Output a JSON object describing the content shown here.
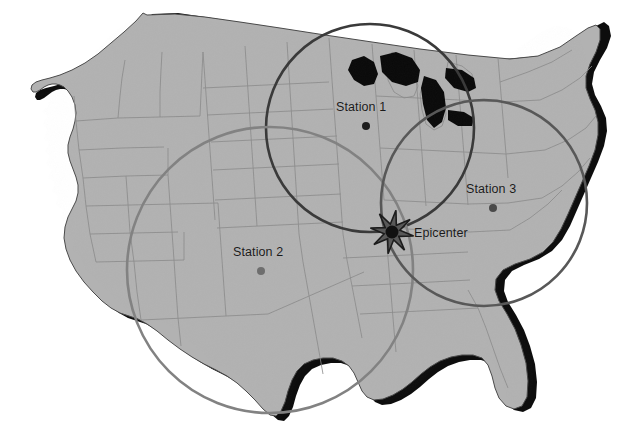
{
  "figure": {
    "background_color": "#ffffff",
    "width": 628,
    "height": 423
  },
  "map": {
    "name": "united-states-map",
    "land_fill": "#b2b2b2",
    "border_stroke": "#8a8a8a",
    "outline_stroke": "#4a4a4a",
    "coast_shadow_fill": "#000000"
  },
  "epicenter": {
    "label": "Epicenter",
    "x": 392,
    "y": 232,
    "label_x": 414,
    "label_y": 226,
    "star_color": "#585858",
    "star_outline": "#1c1c1c",
    "core_color": "#111111",
    "star_radius_outer": 22,
    "star_radius_inner": 8,
    "points": 8
  },
  "stations": [
    {
      "id": "station-1",
      "label": "Station 1",
      "marker_x": 366,
      "marker_y": 126,
      "label_x": 336,
      "label_y": 100,
      "marker_color": "#1c1c1c",
      "marker_radius": 4
    },
    {
      "id": "station-2",
      "label": "Station 2",
      "marker_x": 261,
      "marker_y": 271,
      "label_x": 233,
      "label_y": 245,
      "marker_color": "#6e6e6e",
      "marker_radius": 4
    },
    {
      "id": "station-3",
      "label": "Station 3",
      "marker_x": 493,
      "marker_y": 208,
      "label_x": 466,
      "label_y": 182,
      "marker_color": "#4a4a4a",
      "marker_radius": 4
    }
  ],
  "distance_circles": [
    {
      "id": "circle-station-1",
      "station": "Station 1",
      "center_x": 370,
      "center_y": 128,
      "radius": 104,
      "stroke_color": "#3a3a3a",
      "stroke_width": 2.6
    },
    {
      "id": "circle-station-2",
      "station": "Station 2",
      "center_x": 270,
      "center_y": 270,
      "radius": 143,
      "stroke_color": "#828282",
      "stroke_width": 2.6
    },
    {
      "id": "circle-station-3",
      "station": "Station 3",
      "center_x": 484,
      "center_y": 203,
      "radius": 103,
      "stroke_color": "#585858",
      "stroke_width": 2.6
    }
  ],
  "legend_note": ""
}
